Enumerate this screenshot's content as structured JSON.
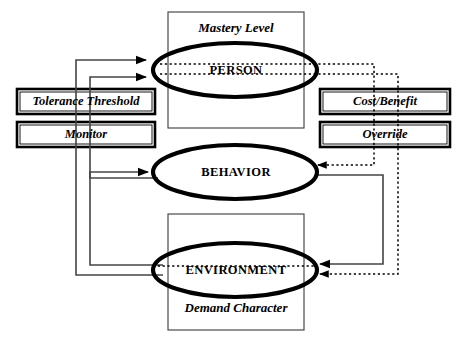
{
  "diagram": {
    "type": "conceptual-block-diagram",
    "colors": {
      "stroke": "#000000",
      "background": "#ffffff",
      "fill": "#ffffff"
    },
    "containers": [
      {
        "id": "mastery-container",
        "label": "Mastery Level",
        "label_position": "top",
        "x": 168,
        "y": 12,
        "width": 136,
        "height": 116
      },
      {
        "id": "demand-container",
        "label": "Demand Character",
        "label_position": "bottom",
        "x": 168,
        "y": 214,
        "width": 136,
        "height": 116
      }
    ],
    "ellipses": [
      {
        "id": "person-ellipse",
        "label": "PERSON",
        "cx": 235,
        "cy": 70,
        "rx": 82,
        "ry": 27
      },
      {
        "id": "behavior-ellipse",
        "label": "BEHAVIOR",
        "cx": 235,
        "cy": 172,
        "rx": 82,
        "ry": 27
      },
      {
        "id": "environment-ellipse",
        "label": "ENVIRONMENT",
        "cx": 235,
        "cy": 270,
        "rx": 82,
        "ry": 27
      }
    ],
    "boxes_left": [
      {
        "id": "tolerance-threshold-box",
        "label": "Tolerance Threshold",
        "x": 17,
        "y": 89,
        "width": 138,
        "height": 25
      },
      {
        "id": "monitor-box",
        "label": "Monitor",
        "x": 17,
        "y": 122,
        "width": 138,
        "height": 25
      }
    ],
    "boxes_right": [
      {
        "id": "cost-benefit-box",
        "label": "Cost/Benefit",
        "x": 320,
        "y": 89,
        "width": 130,
        "height": 25
      },
      {
        "id": "override-box",
        "label": "Override",
        "x": 320,
        "y": 122,
        "width": 130,
        "height": 25
      }
    ],
    "edges": [
      {
        "id": "environment-to-person",
        "style": "solid",
        "from": "environment",
        "to": "person"
      },
      {
        "id": "behavior-to-person",
        "style": "solid",
        "from": "behavior",
        "to": "person"
      },
      {
        "id": "environment-to-behavior",
        "style": "solid",
        "from": "environment",
        "to": "behavior"
      },
      {
        "id": "behavior-to-environment",
        "style": "solid",
        "from": "behavior",
        "to": "environment"
      },
      {
        "id": "person-to-behavior",
        "style": "dotted",
        "from": "person",
        "to": "behavior"
      },
      {
        "id": "person-to-environment",
        "style": "dotted",
        "from": "person",
        "to": "environment"
      }
    ]
  }
}
